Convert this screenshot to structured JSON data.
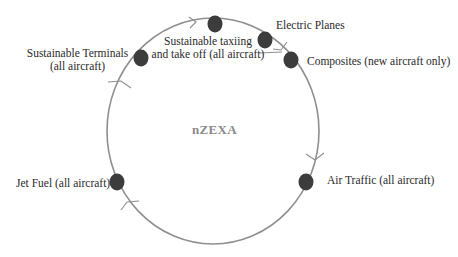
{
  "diagram": {
    "center_label": "nZEXA",
    "colors": {
      "circle_stroke": "#8f8f8f",
      "node_fill": "#3c3c3c",
      "center_text": "#8a8a8a",
      "label_text": "#2a2a2a"
    },
    "nodes": [
      {
        "id": "sustainable-taxiing",
        "label_line1": "Sustainable taxiing",
        "label_line2": "and take off (all aircraft)"
      },
      {
        "id": "electric-planes",
        "label_line1": "Electric Planes"
      },
      {
        "id": "composites",
        "label_line1": "Composites (new aircraft only)"
      },
      {
        "id": "air-traffic",
        "label_line1": "Air Traffic (all aircraft)"
      },
      {
        "id": "jet-fuel",
        "label_line1": "Jet Fuel (all aircraft)"
      },
      {
        "id": "sustainable-terminals",
        "label_line1": "Sustainable Terminals",
        "label_line2": "(all aircraft)"
      }
    ]
  }
}
